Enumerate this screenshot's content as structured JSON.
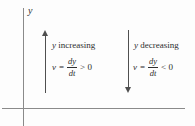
{
  "figure": {
    "axis": {
      "y_label": "y"
    },
    "left": {
      "arrow_direction": "up",
      "label_var": "y",
      "label_word": "increasing",
      "equation": {
        "lhs_var": "v",
        "equals": "=",
        "frac_num": "dy",
        "frac_den": "dt",
        "relation": "> 0"
      }
    },
    "right": {
      "arrow_direction": "down",
      "label_var": "y",
      "label_word": "decreasing",
      "equation": {
        "lhs_var": "v",
        "equals": "=",
        "frac_num": "dy",
        "frac_den": "dt",
        "relation": "< 0"
      }
    },
    "colors": {
      "axis": "#8a8a8a",
      "arrow": "#4f4f4f",
      "text": "#2e2e2e",
      "background": "#fdfdfd"
    }
  }
}
